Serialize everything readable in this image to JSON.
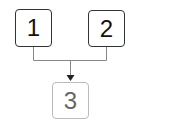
{
  "diagram": {
    "nodes": [
      {
        "id": "1",
        "label": "1"
      },
      {
        "id": "2",
        "label": "2"
      },
      {
        "id": "3",
        "label": "3"
      }
    ],
    "edges": [
      {
        "from": [
          "1",
          "2"
        ],
        "to": "3",
        "type": "merge-arrow"
      }
    ]
  }
}
